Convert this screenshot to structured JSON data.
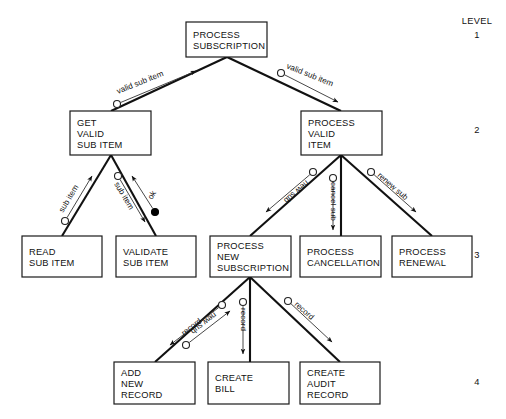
{
  "diagram": {
    "type": "structure-chart",
    "background_color": "#ffffff",
    "line_color": "#111111",
    "level_header": "LEVEL",
    "levels": [
      {
        "number": "1",
        "y": 38
      },
      {
        "number": "2",
        "y": 133
      },
      {
        "number": "3",
        "y": 258
      },
      {
        "number": "4",
        "y": 385
      }
    ],
    "modules": [
      {
        "id": "process-subscription",
        "level": 1,
        "lines": [
          "PROCESS",
          "SUBSCRIPTION"
        ],
        "x": 186,
        "y": 22,
        "w": 81,
        "h": 35
      },
      {
        "id": "get-valid-sub-item",
        "level": 2,
        "lines": [
          "GET",
          "VALID",
          "SUB ITEM"
        ],
        "x": 70,
        "y": 111,
        "w": 81,
        "h": 44
      },
      {
        "id": "process-valid-item",
        "level": 2,
        "lines": [
          "PROCESS",
          "VALID",
          "ITEM"
        ],
        "x": 301,
        "y": 111,
        "w": 81,
        "h": 44
      },
      {
        "id": "read-sub-item",
        "level": 3,
        "lines": [
          "READ",
          "SUB ITEM"
        ],
        "x": 22,
        "y": 236,
        "w": 80,
        "h": 41
      },
      {
        "id": "validate-sub-item",
        "level": 3,
        "lines": [
          "VALIDATE",
          "SUB ITEM"
        ],
        "x": 116,
        "y": 236,
        "w": 80,
        "h": 41
      },
      {
        "id": "process-new-subscription",
        "level": 3,
        "lines": [
          "PROCESS",
          "NEW",
          "SUBSCRIPTION"
        ],
        "x": 210,
        "y": 236,
        "w": 81,
        "h": 41
      },
      {
        "id": "process-cancellation",
        "level": 3,
        "lines": [
          "PROCESS",
          "CANCELLATION"
        ],
        "x": 300,
        "y": 236,
        "w": 81,
        "h": 41
      },
      {
        "id": "process-renewal",
        "level": 3,
        "lines": [
          "PROCESS",
          "RENEWAL"
        ],
        "x": 392,
        "y": 236,
        "w": 80,
        "h": 41
      },
      {
        "id": "add-new-record",
        "level": 4,
        "lines": [
          "ADD",
          "NEW",
          "RECORD"
        ],
        "x": 114,
        "y": 362,
        "w": 81,
        "h": 42
      },
      {
        "id": "create-bill",
        "level": 4,
        "lines": [
          "CREATE",
          "BILL"
        ],
        "x": 208,
        "y": 362,
        "w": 81,
        "h": 42
      },
      {
        "id": "create-audit-record",
        "level": 4,
        "lines": [
          "CREATE",
          "AUDIT",
          "RECORD"
        ],
        "x": 300,
        "y": 362,
        "w": 80,
        "h": 42
      }
    ],
    "connections": [
      {
        "from": "process-subscription",
        "to": "get-valid-sub-item",
        "x1": 227,
        "y1": 57,
        "x2": 111,
        "y2": 111
      },
      {
        "from": "process-subscription",
        "to": "process-valid-item",
        "x1": 227,
        "y1": 57,
        "x2": 341,
        "y2": 111
      },
      {
        "from": "get-valid-sub-item",
        "to": "read-sub-item",
        "x1": 111,
        "y1": 155,
        "x2": 62,
        "y2": 236
      },
      {
        "from": "get-valid-sub-item",
        "to": "validate-sub-item",
        "x1": 111,
        "y1": 155,
        "x2": 156,
        "y2": 236
      },
      {
        "from": "process-valid-item",
        "to": "process-new-subscription",
        "x1": 341,
        "y1": 155,
        "x2": 250,
        "y2": 236
      },
      {
        "from": "process-valid-item",
        "to": "process-cancellation",
        "x1": 341,
        "y1": 155,
        "x2": 341,
        "y2": 236
      },
      {
        "from": "process-valid-item",
        "to": "process-renewal",
        "x1": 341,
        "y1": 155,
        "x2": 432,
        "y2": 236
      },
      {
        "from": "process-new-subscription",
        "to": "add-new-record",
        "x1": 250,
        "y1": 277,
        "x2": 155,
        "y2": 362
      },
      {
        "from": "process-new-subscription",
        "to": "create-bill",
        "x1": 250,
        "y1": 277,
        "x2": 250,
        "y2": 362
      },
      {
        "from": "process-new-subscription",
        "to": "create-audit-record",
        "x1": 250,
        "y1": 277,
        "x2": 340,
        "y2": 362
      }
    ],
    "data_couples": [
      {
        "id": "couple-valid-sub-item-left",
        "label": "valid sub item",
        "type": "data",
        "direction": "up",
        "circle_x": 117,
        "circle_y": 104,
        "arrow_x": 196,
        "arrow_y": 71,
        "label_x": 118,
        "label_y": 94,
        "rotate": -22
      },
      {
        "id": "couple-valid-sub-item-right",
        "label": "valid sub item",
        "type": "data",
        "direction": "down",
        "circle_x": 281,
        "circle_y": 73,
        "arrow_x": 338,
        "arrow_y": 102,
        "label_x": 286,
        "label_y": 68,
        "rotate": 22
      },
      {
        "id": "couple-sub-item-left",
        "label": "sub item",
        "type": "data",
        "direction": "up",
        "circle_x": 65,
        "circle_y": 221,
        "arrow_x": 92,
        "arrow_y": 176,
        "label_x": 63,
        "label_y": 213,
        "rotate": -59
      },
      {
        "id": "couple-sub-item-right",
        "label": "sub item",
        "type": "data",
        "direction": "down",
        "circle_x": 118,
        "circle_y": 176,
        "arrow_x": 145,
        "arrow_y": 222,
        "label_x": 114,
        "label_y": 184,
        "rotate": 59
      },
      {
        "id": "couple-ok",
        "label": "ok",
        "type": "control",
        "direction": "up",
        "circle_x": 155,
        "circle_y": 212,
        "arrow_x": 132,
        "arrow_y": 176,
        "label_x": 152,
        "label_y": 200,
        "rotate": -59
      },
      {
        "id": "couple-new-sub",
        "label": "new sub",
        "type": "data",
        "direction": "down",
        "circle_x": 313,
        "circle_y": 172,
        "arrow_x": 266,
        "arrow_y": 212,
        "label_x": 306,
        "label_y": 180,
        "rotate": 139
      },
      {
        "id": "couple-cancel-sub",
        "label": "cancel sub",
        "type": "data",
        "direction": "down",
        "circle_x": 333,
        "circle_y": 178,
        "arrow_x": 333,
        "arrow_y": 230,
        "label_x": 331,
        "label_y": 182,
        "rotate": 90
      },
      {
        "id": "couple-renew-sub",
        "label": "renew sub",
        "type": "data",
        "direction": "down",
        "circle_x": 371,
        "circle_y": 172,
        "arrow_x": 416,
        "arrow_y": 212,
        "label_x": 377,
        "label_y": 176,
        "rotate": 41
      },
      {
        "id": "couple-new-sub-lower",
        "label": "new sub",
        "type": "data",
        "direction": "down",
        "circle_x": 222,
        "circle_y": 305,
        "arrow_x": 170,
        "arrow_y": 345,
        "label_x": 214,
        "label_y": 312,
        "rotate": 142
      },
      {
        "id": "couple-record-left",
        "label": "record",
        "type": "data",
        "direction": "up",
        "circle_x": 186,
        "circle_y": 345,
        "arrow_x": 230,
        "arrow_y": 311,
        "label_x": 184,
        "label_y": 336,
        "rotate": -38
      },
      {
        "id": "couple-record-middle",
        "label": "record",
        "type": "data",
        "direction": "down",
        "circle_x": 243,
        "circle_y": 302,
        "arrow_x": 243,
        "arrow_y": 354,
        "label_x": 241,
        "label_y": 308,
        "rotate": 90
      },
      {
        "id": "couple-record-right",
        "label": "record",
        "type": "data",
        "direction": "down",
        "circle_x": 288,
        "circle_y": 301,
        "arrow_x": 332,
        "arrow_y": 342,
        "label_x": 294,
        "label_y": 305,
        "rotate": 42
      }
    ]
  }
}
